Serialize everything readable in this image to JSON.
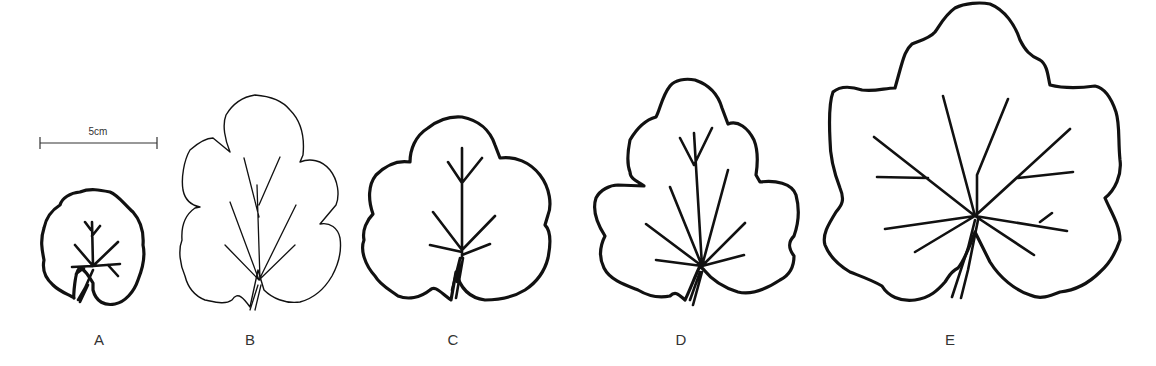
{
  "figure": {
    "scale_bar": {
      "label": "5cm"
    },
    "leaves": [
      {
        "id": "A",
        "label": "A",
        "style": "thick outline, rounded reniform leaf"
      },
      {
        "id": "B",
        "label": "B",
        "style": "thin outline, lobed ovate leaf"
      },
      {
        "id": "C",
        "label": "C",
        "style": "thick outline, shallowly lobed rounded leaf"
      },
      {
        "id": "D",
        "label": "D",
        "style": "thick outline, palmately lobed leaf"
      },
      {
        "id": "E",
        "label": "E",
        "style": "thick outline, large palmately lobed leaf"
      }
    ]
  }
}
